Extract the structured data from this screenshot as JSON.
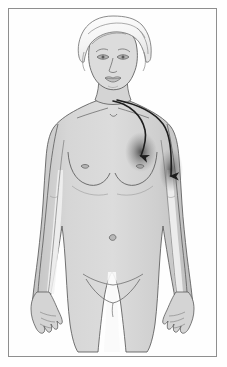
{
  "figure": {
    "style": "grayscale pencil/line-art medical illustration",
    "alt_text": "Line drawing of a woman facing forward with two dark curved arrows descending from the base of the neck, one terminating at the left breast and one terminating at the left axilla"
  },
  "frame": {
    "border_color": "#8f8f8f",
    "background_color": "#fefefe",
    "inset_px": 8
  },
  "colors": {
    "page_background": "#ffffff",
    "skin_fill": "#cfcfcf",
    "skin_fill_light": "#dedede",
    "skin_highlight": "#f2f2f2",
    "hair_fill": "#f7f7f7",
    "outline": "#555555",
    "line_detail": "#6e6e6e",
    "arrow_color": "#1e1e1e",
    "shadow_blob": "#4a4a4a"
  },
  "body_parts": [
    {
      "name": "hair",
      "label": "Hair"
    },
    {
      "name": "face",
      "label": "Face"
    },
    {
      "name": "neck",
      "label": "Neck"
    },
    {
      "name": "shoulders",
      "label": "Shoulders"
    },
    {
      "name": "breasts",
      "label": "Breasts"
    },
    {
      "name": "abdomen",
      "label": "Abdomen"
    },
    {
      "name": "navel",
      "label": "Navel"
    },
    {
      "name": "pelvis",
      "label": "Pelvis"
    },
    {
      "name": "arms",
      "label": "Arms"
    },
    {
      "name": "hands",
      "label": "Hands"
    },
    {
      "name": "thighs",
      "label": "Thighs"
    }
  ],
  "annotations": {
    "arrows": [
      {
        "id": "arrow-to-breast",
        "label": "Drainage arrow to breast",
        "origin": "base of neck",
        "target": "left breast",
        "direction": "downward",
        "color": "#1e1e1e",
        "has_shadow": true
      },
      {
        "id": "arrow-to-axilla",
        "label": "Drainage arrow to axilla",
        "origin": "base of neck",
        "target": "left axilla",
        "direction": "downward",
        "color": "#1e1e1e",
        "has_shadow": true
      }
    ]
  }
}
